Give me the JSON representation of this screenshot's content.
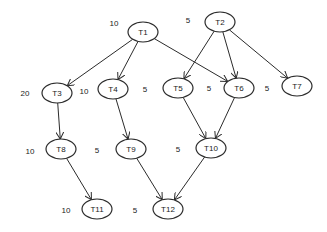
{
  "diagram": {
    "type": "task-dependency-graph",
    "nodes": [
      {
        "id": "T1",
        "label": "T1",
        "weight": "10",
        "cx": 143,
        "cy": 32,
        "wx": 114,
        "wy": 23
      },
      {
        "id": "T2",
        "label": "T2",
        "weight": "5",
        "cx": 220,
        "cy": 22,
        "wx": 188,
        "wy": 20
      },
      {
        "id": "T3",
        "label": "T3",
        "weight": "20",
        "cx": 57,
        "cy": 93,
        "wx": 25,
        "wy": 93
      },
      {
        "id": "T4",
        "label": "T4",
        "weight": "10",
        "cx": 113,
        "cy": 89,
        "wx": 84,
        "wy": 91
      },
      {
        "id": "T5",
        "label": "T5",
        "weight": "5",
        "cx": 178,
        "cy": 88,
        "wx": 145,
        "wy": 89
      },
      {
        "id": "T6",
        "label": "T6",
        "weight": "5",
        "cx": 239,
        "cy": 88,
        "wx": 209,
        "wy": 88
      },
      {
        "id": "T7",
        "label": "T7",
        "weight": "5",
        "cx": 297,
        "cy": 86,
        "wx": 267,
        "wy": 88
      },
      {
        "id": "T8",
        "label": "T8",
        "weight": "10",
        "cx": 61,
        "cy": 149,
        "wx": 30,
        "wy": 151
      },
      {
        "id": "T9",
        "label": "T9",
        "weight": "5",
        "cx": 131,
        "cy": 149,
        "wx": 97,
        "wy": 150
      },
      {
        "id": "T10",
        "label": "T10",
        "weight": "5",
        "cx": 211,
        "cy": 148,
        "wx": 178,
        "wy": 149
      },
      {
        "id": "T11",
        "label": "T11",
        "weight": "10",
        "cx": 97,
        "cy": 209,
        "wx": 66,
        "wy": 210
      },
      {
        "id": "T12",
        "label": "T12",
        "weight": "5",
        "cx": 168,
        "cy": 209,
        "wx": 135,
        "wy": 210
      }
    ],
    "edges": [
      {
        "from": "T1",
        "to": "T3"
      },
      {
        "from": "T1",
        "to": "T4"
      },
      {
        "from": "T1",
        "to": "T6"
      },
      {
        "from": "T2",
        "to": "T5"
      },
      {
        "from": "T2",
        "to": "T6"
      },
      {
        "from": "T2",
        "to": "T7"
      },
      {
        "from": "T3",
        "to": "T8"
      },
      {
        "from": "T4",
        "to": "T9"
      },
      {
        "from": "T5",
        "to": "T10"
      },
      {
        "from": "T6",
        "to": "T10"
      },
      {
        "from": "T8",
        "to": "T11"
      },
      {
        "from": "T9",
        "to": "T12"
      },
      {
        "from": "T10",
        "to": "T12"
      }
    ],
    "node_rx": 15,
    "node_ry": 10,
    "colors": {
      "stroke": "#2b2b2b",
      "text": "#1a1a1a",
      "background": "#ffffff"
    }
  }
}
